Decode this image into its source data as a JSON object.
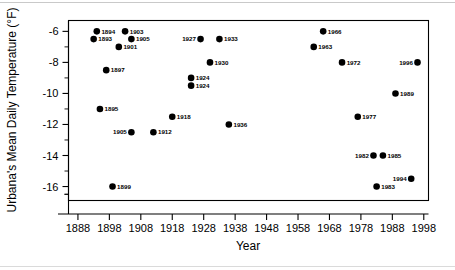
{
  "chart_data": {
    "type": "scatter",
    "title": "",
    "xlabel": "Year",
    "ylabel": "Urbana's Mean Daily Temperature (°F)",
    "xlim": [
      1885,
      1999.5
    ],
    "ylim": [
      -16.9,
      -5.3
    ],
    "xticks": [
      1888,
      1898,
      1908,
      1918,
      1928,
      1938,
      1948,
      1958,
      1968,
      1978,
      1988,
      1998
    ],
    "xtick_labels": [
      "1888",
      "1898",
      "1908",
      "1918",
      "1928",
      "1938",
      "1948",
      "1958",
      "1968",
      "1978",
      "1988",
      "1998"
    ],
    "yticks": [
      -6,
      -8,
      -10,
      -12,
      -14,
      -16
    ],
    "ytick_labels": [
      "-6",
      "-8",
      "-10",
      "-12",
      "-14",
      "-16"
    ],
    "y_minor_ticks": [
      -7,
      -9,
      -11,
      -13,
      -15,
      -16.5
    ],
    "grid": false,
    "legend": null,
    "marker_color": "#000000",
    "points": [
      {
        "label": "1894",
        "x": 1894,
        "y": -6.0,
        "label_side": "right"
      },
      {
        "label": "1903",
        "x": 1903,
        "y": -6.0,
        "label_side": "right"
      },
      {
        "label": "1966",
        "x": 1966,
        "y": -6.0,
        "label_side": "right"
      },
      {
        "label": "1893",
        "x": 1893,
        "y": -6.5,
        "label_side": "right"
      },
      {
        "label": "1905",
        "x": 1905,
        "y": -6.5,
        "label_side": "right"
      },
      {
        "label": "1927",
        "x": 1927,
        "y": -6.5,
        "label_side": "left"
      },
      {
        "label": "1933",
        "x": 1933,
        "y": -6.5,
        "label_side": "right"
      },
      {
        "label": "1901",
        "x": 1901,
        "y": -7.0,
        "label_side": "right"
      },
      {
        "label": "1963",
        "x": 1963,
        "y": -7.0,
        "label_side": "right"
      },
      {
        "label": "1930",
        "x": 1930,
        "y": -8.0,
        "label_side": "right"
      },
      {
        "label": "1972",
        "x": 1972,
        "y": -8.0,
        "label_side": "right"
      },
      {
        "label": "1996",
        "x": 1996,
        "y": -8.0,
        "label_side": "left"
      },
      {
        "label": "1897",
        "x": 1897,
        "y": -8.5,
        "label_side": "right"
      },
      {
        "label": "1924",
        "x": 1924,
        "y": -9.0,
        "label_side": "right"
      },
      {
        "label": "1924",
        "x": 1924,
        "y": -9.5,
        "label_side": "right"
      },
      {
        "label": "1989",
        "x": 1989,
        "y": -10.0,
        "label_side": "right"
      },
      {
        "label": "1895",
        "x": 1895,
        "y": -11.0,
        "label_side": "right"
      },
      {
        "label": "1918",
        "x": 1918,
        "y": -11.5,
        "label_side": "right"
      },
      {
        "label": "1977",
        "x": 1977,
        "y": -11.5,
        "label_side": "right"
      },
      {
        "label": "1936",
        "x": 1936,
        "y": -12.0,
        "label_side": "right"
      },
      {
        "label": "1905",
        "x": 1905,
        "y": -12.5,
        "label_side": "left"
      },
      {
        "label": "1912",
        "x": 1912,
        "y": -12.5,
        "label_side": "right"
      },
      {
        "label": "1982",
        "x": 1982,
        "y": -14.0,
        "label_side": "left"
      },
      {
        "label": "1985",
        "x": 1985,
        "y": -14.0,
        "label_side": "right"
      },
      {
        "label": "1994",
        "x": 1994,
        "y": -15.5,
        "label_side": "left"
      },
      {
        "label": "1899",
        "x": 1899,
        "y": -16.0,
        "label_side": "right"
      },
      {
        "label": "1983",
        "x": 1983,
        "y": -16.0,
        "label_side": "right"
      }
    ]
  }
}
